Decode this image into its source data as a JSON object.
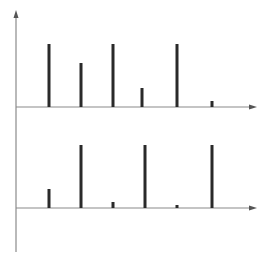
{
  "figure": {
    "colors": {
      "axis": "#8a8a8a",
      "bar": "#2a2a2a",
      "background": "#ffffff"
    }
  },
  "chart_data": [
    {
      "type": "bar",
      "title": "",
      "xlabel": "",
      "ylabel": "",
      "style": "stem",
      "grid": false,
      "legend": null,
      "categories": [
        "1",
        "2",
        "3",
        "4",
        "5",
        "6"
      ],
      "x_px": [
        49,
        81,
        113,
        142,
        177,
        212
      ],
      "values": [
        63,
        44,
        63,
        19,
        63,
        6
      ],
      "ylim": [
        0,
        70
      ]
    },
    {
      "type": "bar",
      "title": "",
      "xlabel": "",
      "ylabel": "",
      "style": "stem",
      "grid": false,
      "legend": null,
      "categories": [
        "1",
        "2",
        "3",
        "4",
        "5",
        "6"
      ],
      "x_px": [
        49,
        81,
        113,
        145,
        177,
        212
      ],
      "values": [
        19,
        63,
        6,
        63,
        3,
        63
      ],
      "ylim": [
        0,
        70
      ]
    }
  ]
}
